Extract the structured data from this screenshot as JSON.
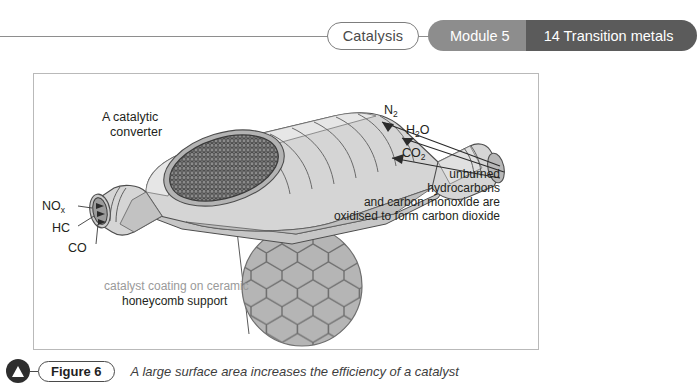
{
  "header": {
    "topic_label": "Catalysis",
    "module_label": "Module 5",
    "unit_label": "14 Transition metals",
    "colors": {
      "module_bg": "#8d8d8d",
      "unit_bg": "#5b5b5b",
      "rule": "#8e8e8e",
      "pill_border": "#7d7d7d"
    }
  },
  "figure": {
    "title_label": "A catalytic",
    "title_label_line2": "converter",
    "inlet_labels": [
      {
        "text": "NO",
        "sub": "x"
      },
      {
        "text": "HC",
        "sub": ""
      },
      {
        "text": "CO",
        "sub": ""
      }
    ],
    "outlet_labels": [
      {
        "text": "N",
        "sub": "2"
      },
      {
        "text": "H",
        "sub": "2",
        "suffix": "O"
      },
      {
        "text": "CO",
        "sub": "2"
      }
    ],
    "reaction_note": [
      "unburned",
      "hydrocarbons",
      "and carbon monoxide are",
      "oxidised to form carbon dioxide"
    ],
    "support_note": [
      "catalyst coating on ceramic",
      "honeycomb support"
    ],
    "colors": {
      "frame_border": "#b9b9b9",
      "body_fill": "#d5d5d5",
      "body_shade": "#bfbfbf",
      "body_light": "#e6e6e6",
      "mesh_dark": "#6e6e6e",
      "honeycomb_fill": "#b5b5b5",
      "honeycomb_line": "#6f6f6f",
      "outline": "#4d4d4d"
    }
  },
  "caption": {
    "marker_icon": "triangle-up-icon",
    "figure_label": "Figure 6",
    "text": "A large surface area increases the efficiency of a catalyst"
  }
}
